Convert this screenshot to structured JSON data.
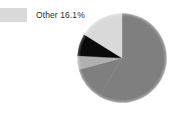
{
  "figure": {
    "background_color": "#ffffff",
    "width": 178,
    "height": 117
  },
  "legend": {
    "position": "top-left",
    "items": [
      {
        "label": "Other 16.1%",
        "name": "Other",
        "value": 16.1,
        "color": "#d9d9d9"
      }
    ]
  },
  "chart_data": {
    "type": "pie",
    "title": "",
    "subtitle": "",
    "xlabel": "",
    "ylabel": "",
    "start_angle_deg": 90,
    "direction": "clockwise",
    "grid": false,
    "legend_position": "top-left",
    "labels": [
      "Slice 1",
      "Slice 2",
      "Slice 3",
      "Slice 4",
      "Other"
    ],
    "values": [
      58.3,
      12.5,
      5.0,
      8.1,
      16.1
    ],
    "colors": [
      "#7f7f7f",
      "#7f7f7f",
      "#b0b0b0",
      "#0a0a0a",
      "#d9d9d9"
    ],
    "annotations": [
      "Other 16.1%"
    ],
    "slices": [
      {
        "label": "Slice 1",
        "value": 58.3,
        "color": "#7f7f7f",
        "start_deg": 0,
        "end_deg": 210
      },
      {
        "label": "Slice 2",
        "value": 12.5,
        "color": "#7f7f7f",
        "start_deg": 210,
        "end_deg": 255
      },
      {
        "label": "Slice 3",
        "value": 5.0,
        "color": "#b0b0b0",
        "start_deg": 255,
        "end_deg": 273
      },
      {
        "label": "Slice 4",
        "value": 8.1,
        "color": "#0a0a0a",
        "start_deg": 273,
        "end_deg": 302
      },
      {
        "label": "Other",
        "value": 16.1,
        "color": "#d9d9d9",
        "start_deg": 302,
        "end_deg": 360
      }
    ]
  }
}
